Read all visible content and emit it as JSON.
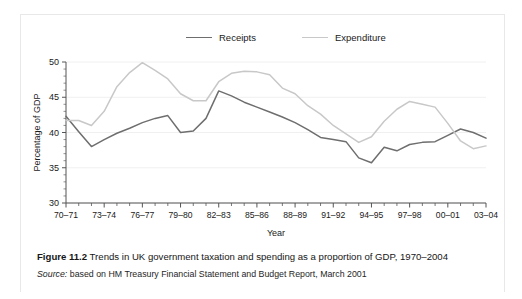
{
  "figure": {
    "caption_number": "Figure 11.2",
    "caption_text": " Trends in UK government taxation and spending as a proportion of GDP, 1970–2004",
    "source_label": "Source:",
    "source_text": " based on HM Treasury Financial Statement and Budget Report, March 2001"
  },
  "legend": {
    "items": [
      {
        "label": "Receipts",
        "color": "#6e6e6e"
      },
      {
        "label": "Expenditure",
        "color": "#c8c8c8"
      }
    ]
  },
  "chart_data": {
    "type": "line",
    "title": "",
    "xlabel": "Year",
    "ylabel": "Percentage of GDP",
    "ylim": [
      30,
      50
    ],
    "yticks": [
      30,
      35,
      40,
      45,
      50
    ],
    "ytick_labels": [
      "30",
      "35",
      "40",
      "45",
      "50"
    ],
    "grid": true,
    "legend_position": "top-center",
    "x": [
      "70–71",
      "71–72",
      "72–73",
      "73–74",
      "74–75",
      "75–76",
      "76–77",
      "77–78",
      "78–79",
      "79–80",
      "80–81",
      "81–82",
      "82–83",
      "83–84",
      "84–85",
      "85–86",
      "86–87",
      "87–88",
      "88–89",
      "89–90",
      "90–91",
      "91–92",
      "92–93",
      "93–94",
      "94–95",
      "95–96",
      "96–97",
      "97–98",
      "98–99",
      "99–00",
      "00–01",
      "01–02",
      "02–03",
      "03–04"
    ],
    "xtick_labels": [
      "70–71",
      "73–74",
      "76–77",
      "79–80",
      "82–83",
      "85–86",
      "88–89",
      "91–92",
      "94–95",
      "97–98",
      "00–01",
      "03–04"
    ],
    "xtick_label_indices": [
      0,
      3,
      6,
      9,
      12,
      15,
      18,
      21,
      24,
      27,
      30,
      33
    ],
    "series": [
      {
        "name": "Receipts",
        "color": "#6e6e6e",
        "values": [
          42.3,
          40.1,
          38.0,
          39.0,
          39.9,
          40.6,
          41.4,
          42.0,
          42.4,
          40.0,
          40.2,
          42.0,
          45.9,
          45.2,
          44.3,
          43.6,
          42.9,
          42.2,
          41.4,
          40.4,
          39.3,
          39.0,
          38.7,
          36.4,
          35.7,
          37.9,
          37.4,
          38.3,
          38.6,
          38.7,
          39.6,
          40.5,
          40.0,
          39.2
        ]
      },
      {
        "name": "Expenditure",
        "color": "#c8c8c8",
        "values": [
          41.7,
          41.7,
          41.0,
          43.0,
          46.5,
          48.5,
          49.9,
          48.8,
          47.6,
          45.5,
          44.5,
          44.5,
          47.2,
          48.4,
          48.7,
          48.6,
          48.2,
          46.3,
          45.5,
          43.8,
          42.6,
          41.0,
          39.8,
          38.6,
          39.4,
          41.6,
          43.3,
          44.4,
          44.0,
          43.6,
          41.3,
          38.8,
          37.7,
          38.1
        ]
      }
    ]
  }
}
